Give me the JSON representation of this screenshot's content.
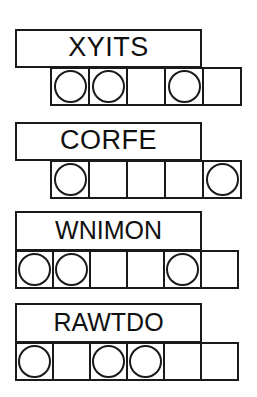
{
  "sheet": {
    "title": "word-scramble-worksheet",
    "ink_color": "#1a1a1a",
    "paper_color": "#ffffff"
  },
  "puzzles": [
    {
      "id": "puzzle-1",
      "scrambled_word": "XYITS",
      "letter_count": 5,
      "answer_cells": 5,
      "circled_cells": [
        1,
        2,
        4
      ]
    },
    {
      "id": "puzzle-2",
      "scrambled_word": "CORFE",
      "letter_count": 5,
      "answer_cells": 5,
      "circled_cells": [
        1,
        5
      ]
    },
    {
      "id": "puzzle-3",
      "scrambled_word": "WNIMON",
      "letter_count": 6,
      "answer_cells": 6,
      "circled_cells": [
        1,
        2,
        5
      ]
    },
    {
      "id": "puzzle-4",
      "scrambled_word": "RAWTDO",
      "letter_count": 6,
      "answer_cells": 6,
      "circled_cells": [
        1,
        3,
        4
      ]
    }
  ]
}
